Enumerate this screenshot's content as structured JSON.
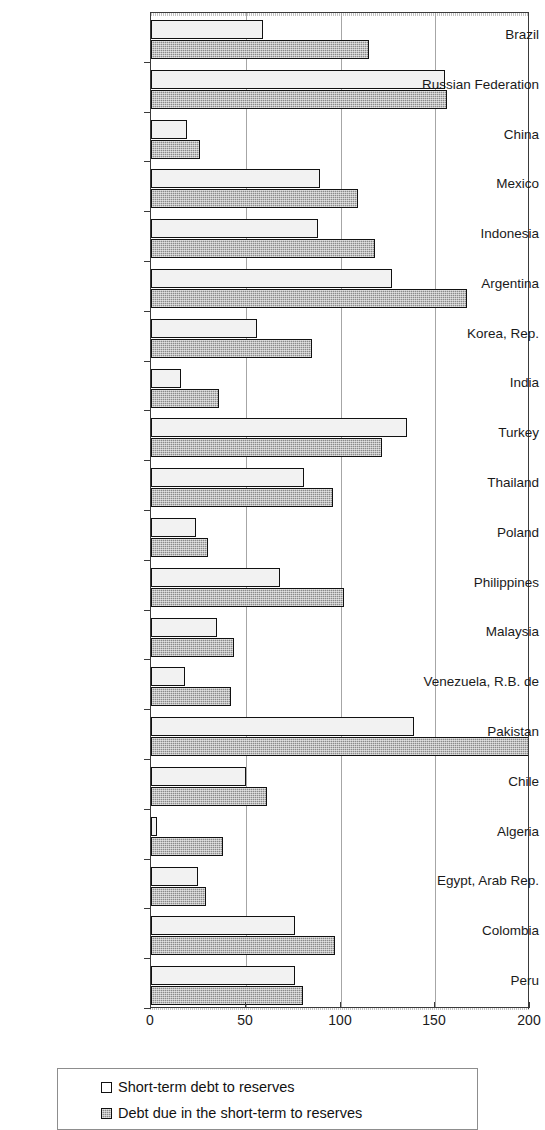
{
  "chart_data": {
    "type": "bar",
    "orientation": "horizontal",
    "title": "",
    "subtitle": "",
    "xlabel": "",
    "ylabel": "",
    "xlim": [
      0,
      200
    ],
    "xticks": [
      0,
      50,
      100,
      150,
      200
    ],
    "xtick_labels": [
      "0",
      "50",
      "100",
      "150",
      "200"
    ],
    "grid": "vertical",
    "legend_position": "bottom",
    "categories": [
      "Brazil",
      "Russian Federation",
      "China",
      "Mexico",
      "Indonesia",
      "Argentina",
      "Korea, Rep.",
      "India",
      "Turkey",
      "Thailand",
      "Poland",
      "Philippines",
      "Malaysia",
      "Venezuela, R.B. de",
      "Pakistan",
      "Chile",
      "Algeria",
      "Egypt, Arab Rep.",
      "Colombia",
      "Peru"
    ],
    "series": [
      {
        "name": "Short-term debt to reserves",
        "style": "light",
        "color": "#f2f2f2",
        "values": [
          59,
          155,
          19,
          89,
          88,
          127,
          56,
          16,
          135,
          81,
          24,
          68,
          35,
          18,
          139,
          50,
          3,
          25,
          76,
          76
        ]
      },
      {
        "name": "Debt due in the short-term to reserves",
        "style": "dark",
        "color": "#8a8a8a",
        "values": [
          115,
          156,
          26,
          109,
          118,
          167,
          85,
          36,
          122,
          96,
          30,
          102,
          44,
          42,
          202,
          61,
          38,
          29,
          97,
          80
        ]
      }
    ]
  },
  "legend": {
    "items": [
      {
        "label": "Short-term debt to reserves",
        "style": "light"
      },
      {
        "label": "Debt due in the short-term to reserves",
        "style": "dark"
      }
    ]
  },
  "colors": {
    "light_bar": "#f2f2f2",
    "dark_bar": "#8a8a8a",
    "bar_outline": "#111111",
    "gridline": "#a6a6a6",
    "axis": "#3a3a3a",
    "text": "#1a1a1a",
    "background": "#ffffff"
  }
}
